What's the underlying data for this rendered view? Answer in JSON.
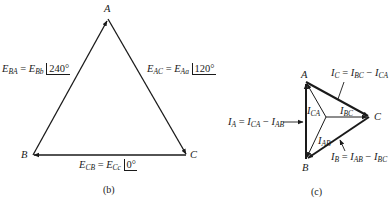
{
  "figure_b": {
    "caption": "(b)",
    "vertices": {
      "A": "A",
      "B": "B",
      "C": "C"
    },
    "labels": {
      "ba": {
        "lhs": "E",
        "lhs_sub": "BA",
        "eq": " = ",
        "rhs": "E",
        "rhs_sub": "Bb",
        "angle": "240°"
      },
      "ac": {
        "lhs": "E",
        "lhs_sub": "AC",
        "eq": " = ",
        "rhs": "E",
        "rhs_sub": "Aa",
        "angle": "120°"
      },
      "cb": {
        "lhs": "E",
        "lhs_sub": "CB",
        "eq": " = ",
        "rhs": "E",
        "rhs_sub": "Cc",
        "angle": "0°"
      }
    }
  },
  "figure_c": {
    "caption": "(c)",
    "vertices": {
      "A": "A",
      "B": "B",
      "C": "C"
    },
    "labels": {
      "ic": {
        "lhs": "I",
        "lhs_sub": "C",
        "eq": " = ",
        "t1": "I",
        "t1_sub": "BC",
        "minus": " − ",
        "t2": "I",
        "t2_sub": "CA"
      },
      "ia": {
        "lhs": "I",
        "lhs_sub": "A",
        "eq": " = ",
        "t1": "I",
        "t1_sub": "CA",
        "minus": " − ",
        "t2": "I",
        "t2_sub": "AB"
      },
      "ib": {
        "lhs": "I",
        "lhs_sub": "B",
        "eq": " = ",
        "t1": "I",
        "t1_sub": "AB",
        "minus": " − ",
        "t2": "I",
        "t2_sub": "BC"
      },
      "ica": {
        "sym": "I",
        "sub": "CA"
      },
      "ibc": {
        "sym": "I",
        "sub": "BC"
      },
      "iab": {
        "sym": "I",
        "sub": "AB"
      }
    }
  },
  "colors": {
    "ink": "#1a1a1a",
    "background": "#ffffff"
  }
}
